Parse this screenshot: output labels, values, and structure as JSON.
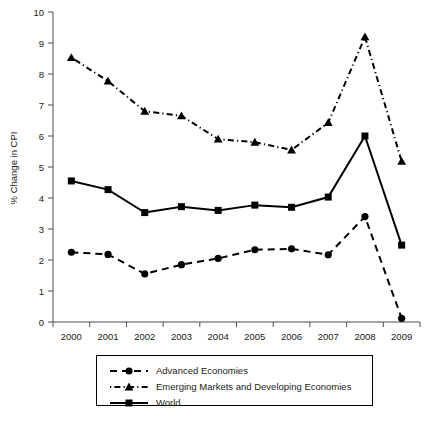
{
  "chart_data": {
    "type": "line",
    "title": "",
    "xlabel": "",
    "ylabel": "% Change in CPI",
    "x": [
      "2000",
      "2001",
      "2002",
      "2003",
      "2004",
      "2005",
      "2006",
      "2007",
      "2008",
      "2009"
    ],
    "categories": [
      "2000",
      "2001",
      "2002",
      "2003",
      "2004",
      "2005",
      "2006",
      "2007",
      "2008",
      "2009"
    ],
    "xlim": [
      2000,
      2009
    ],
    "ylim": [
      0,
      10
    ],
    "yticks": [
      "0",
      "1",
      "2",
      "3",
      "4",
      "5",
      "6",
      "7",
      "8",
      "9",
      "10"
    ],
    "grid": false,
    "legend_position": "bottom",
    "series": [
      {
        "name": "Advanced Economies",
        "marker": "circle",
        "linestyle": "dashed",
        "color": "#000000",
        "values": [
          2.25,
          2.18,
          1.55,
          1.85,
          2.05,
          2.33,
          2.36,
          2.17,
          3.4,
          0.12
        ]
      },
      {
        "name": "Emerging Markets and Developing Economies",
        "marker": "triangle",
        "linestyle": "dash-dot",
        "color": "#000000",
        "values": [
          8.53,
          7.77,
          6.8,
          6.65,
          5.9,
          5.8,
          5.55,
          6.43,
          9.2,
          5.18
        ]
      },
      {
        "name": "World",
        "marker": "square",
        "linestyle": "solid",
        "color": "#000000",
        "values": [
          4.55,
          4.27,
          3.53,
          3.72,
          3.6,
          3.77,
          3.7,
          4.03,
          6.0,
          2.48
        ]
      }
    ]
  },
  "legend": {
    "entries": [
      {
        "label": "Advanced Economies",
        "marker": "circle-marker",
        "linestyle": "dashed"
      },
      {
        "label": "Emerging Markets and Developing Economies",
        "marker": "triangle-marker",
        "linestyle": "dash-dot"
      },
      {
        "label": "World",
        "marker": "square-marker",
        "linestyle": "solid"
      }
    ]
  },
  "colors": {
    "ink": "#000000",
    "axis": "#4d4d4d",
    "background": "#ffffff"
  }
}
